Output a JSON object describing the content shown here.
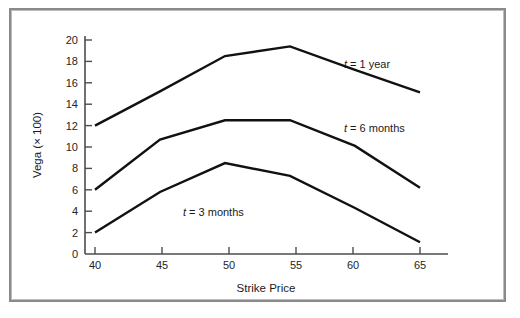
{
  "chart_data": {
    "type": "line",
    "title": "",
    "xlabel": "Strike Price",
    "ylabel": "Vega (× 100)",
    "x": [
      40,
      45,
      50,
      55,
      60,
      65
    ],
    "xlim": [
      38.5,
      66.5
    ],
    "ylim": [
      0,
      20.8
    ],
    "xticks": [
      "40",
      "45",
      "50",
      "55",
      "60",
      "65"
    ],
    "yticks": [
      "0",
      "2",
      "4",
      "6",
      "8",
      "10",
      "12",
      "14",
      "16",
      "18",
      "20"
    ],
    "grid": false,
    "legend_position": "inline-annotations",
    "series": [
      {
        "name": "t = 1 year",
        "label_var": "t",
        "label_rest": "= 1 year",
        "values": [
          12.0,
          15.2,
          18.5,
          19.4,
          17.2,
          15.1
        ],
        "color": "#111111"
      },
      {
        "name": "t = 6 months",
        "label_var": "t",
        "label_rest": "= 6 months",
        "values": [
          6.0,
          10.7,
          12.5,
          12.5,
          10.1,
          6.2
        ],
        "color": "#111111"
      },
      {
        "name": "t = 3 months",
        "label_var": "t",
        "label_rest": "= 3 months",
        "values": [
          2.0,
          5.8,
          8.5,
          7.3,
          4.3,
          1.1
        ],
        "color": "#111111"
      }
    ],
    "annotations": [
      {
        "text": "t = 1 year",
        "var": "t",
        "rest": "= 1 year",
        "x_px": 333,
        "y_px": 58
      },
      {
        "text": "t = 6 months",
        "var": "t",
        "rest": "= 6 months",
        "x_px": 333,
        "y_px": 122
      },
      {
        "text": "t = 3 months",
        "var": "t",
        "rest": "= 3 months",
        "x_px": 172,
        "y_px": 206
      }
    ]
  },
  "figure": {
    "background_color": "#ffffff",
    "frame_color": "#8a8a8a",
    "axis_color": "#4d4d4d",
    "line_color": "#111111"
  }
}
